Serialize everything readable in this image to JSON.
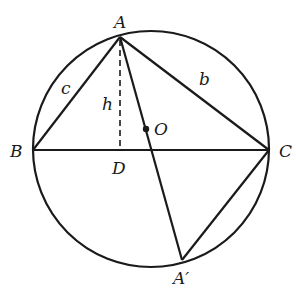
{
  "diagram": {
    "type": "geometry",
    "circle": {
      "center": "O",
      "cx": 151,
      "cy": 149,
      "r": 118
    },
    "points": {
      "A": {
        "label": "A",
        "x": 120,
        "y": 37
      },
      "B": {
        "label": "B",
        "x": 33,
        "y": 150
      },
      "C": {
        "label": "C",
        "x": 269,
        "y": 150
      },
      "D": {
        "label": "D",
        "x": 120,
        "y": 150
      },
      "O": {
        "label": "O",
        "x": 146,
        "y": 129
      },
      "A_prime": {
        "label": "A′",
        "x": 182,
        "y": 260
      }
    },
    "side_labels": {
      "c": "c",
      "b": "b",
      "h": "h"
    },
    "colors": {
      "stroke": "#1a1a1a",
      "background": "#ffffff"
    }
  }
}
